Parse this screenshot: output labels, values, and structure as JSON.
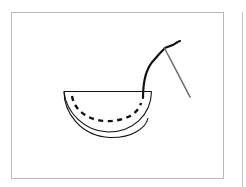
{
  "figure": {
    "elements": {
      "fabric": "half-circle-fabric",
      "stitches": "dashed-stitch-line",
      "thread": "thread",
      "needle": "sewing-needle"
    },
    "colors": {
      "frame_border": "#b9b9b9",
      "line": "#111111",
      "needle": "#6a6a6a",
      "background": "#ffffff"
    }
  }
}
